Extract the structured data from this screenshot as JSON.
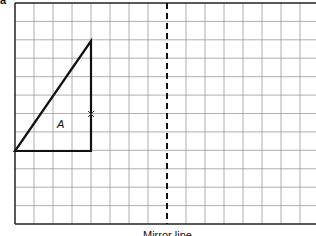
{
  "diagram": {
    "type": "reflection-grid",
    "question_marker": "a",
    "grid": {
      "left": 15,
      "top": 3,
      "cell": 19,
      "cols": 16,
      "rows": 12,
      "bottom": 224
    },
    "shape": {
      "name": "A",
      "vertices": [
        [
          91,
          41
        ],
        [
          15,
          152
        ],
        [
          91,
          152
        ]
      ],
      "marked_point": [
        91,
        114
      ]
    },
    "mirror_line": {
      "x": 167,
      "label": "Mirror line"
    }
  }
}
